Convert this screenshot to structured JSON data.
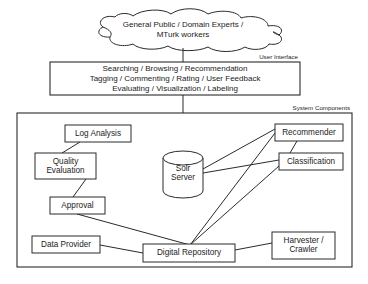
{
  "diagram": {
    "actors_cloud": {
      "name": "actors-cloud",
      "line1": "General Public / Domain Experts /",
      "line2": "MTurk workers",
      "text": "General Public / Domain Experts /\nMTurk workers"
    },
    "groups": [
      {
        "id": "user-interface",
        "label": "User Interface",
        "x": 50,
        "y": 62,
        "w": 250,
        "h": 33
      },
      {
        "id": "system-components",
        "label": "System Components",
        "x": 17,
        "y": 113,
        "w": 335,
        "h": 154
      }
    ],
    "ui_lines": [
      "Searching / Browsing / Recommendation",
      "Tagging / Commenting / Rating / User Feedback",
      "Evaluating / Visualization / Labeling"
    ],
    "nodes": [
      {
        "id": "log-analysis",
        "label": "Log Analysis",
        "shape": "rect",
        "x": 65,
        "y": 125,
        "w": 66,
        "h": 17
      },
      {
        "id": "quality-evaluation",
        "label": "Quality\nEvaluation",
        "shape": "rect",
        "x": 35,
        "y": 153,
        "w": 61,
        "h": 26
      },
      {
        "id": "approval",
        "label": "Approval",
        "shape": "rect",
        "x": 50,
        "y": 197,
        "w": 55,
        "h": 17
      },
      {
        "id": "data-provider",
        "label": "Data Provider",
        "shape": "rect",
        "x": 32,
        "y": 236,
        "w": 68,
        "h": 17
      },
      {
        "id": "digital-repository",
        "label": "Digital Repository",
        "shape": "rect",
        "x": 143,
        "y": 244,
        "w": 92,
        "h": 18
      },
      {
        "id": "solr-server",
        "label": "Solr\nServer",
        "shape": "cylinder",
        "x": 163,
        "y": 151,
        "w": 40,
        "h": 47
      },
      {
        "id": "recommender",
        "label": "Recommender",
        "shape": "rect",
        "x": 275,
        "y": 124,
        "w": 68,
        "h": 17
      },
      {
        "id": "classification",
        "label": "Classification",
        "shape": "rect",
        "x": 279,
        "y": 153,
        "w": 64,
        "h": 17
      },
      {
        "id": "harvester-crawler",
        "label": "Harvester /\nCrawler",
        "shape": "rect",
        "x": 272,
        "y": 232,
        "w": 63,
        "h": 27
      }
    ],
    "edges": [
      {
        "id": "cloud-to-ui",
        "from": "actors-cloud",
        "to": "user-interface"
      },
      {
        "id": "ui-to-system",
        "from": "user-interface",
        "to": "system-components"
      },
      {
        "id": "log-analysis-quality",
        "from": "log-analysis",
        "to": "quality-evaluation"
      },
      {
        "id": "quality-approval",
        "from": "quality-evaluation",
        "to": "approval"
      },
      {
        "id": "approval-repository",
        "from": "approval",
        "to": "digital-repository"
      },
      {
        "id": "data-provider-repository",
        "from": "data-provider",
        "to": "digital-repository"
      },
      {
        "id": "repository-harvester",
        "from": "digital-repository",
        "to": "harvester-crawler"
      },
      {
        "id": "repository-recommender",
        "from": "digital-repository",
        "to": "recommender"
      },
      {
        "id": "repository-classification",
        "from": "digital-repository",
        "to": "classification"
      },
      {
        "id": "solr-classification",
        "from": "solr-server",
        "to": "classification"
      },
      {
        "id": "recommender-classification",
        "from": "recommender",
        "to": "classification"
      },
      {
        "id": "solr-recommender",
        "from": "solr-server",
        "to": "recommender"
      }
    ],
    "colors": {
      "stroke": "#2a2a2a",
      "fill": "#ffffff",
      "text": "#1c1c1c"
    }
  }
}
